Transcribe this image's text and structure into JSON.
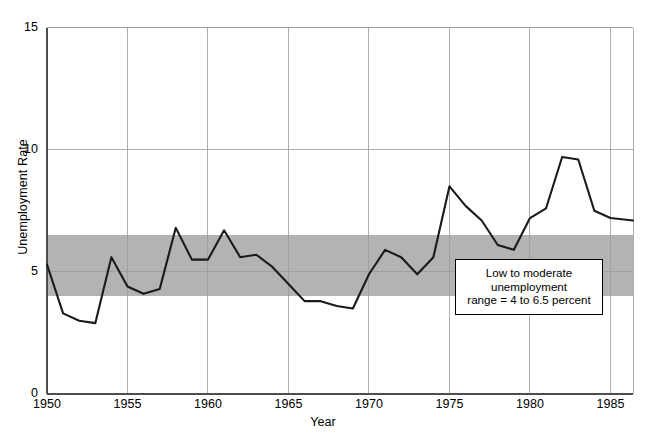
{
  "figure": {
    "cropped_caption_top": "",
    "axes": {
      "ylabel": "Unemployment Rate",
      "xlabel": "Year",
      "yticks": [
        "0",
        "5",
        "10",
        "15"
      ],
      "xticks": [
        "1950",
        "1955",
        "1960",
        "1965",
        "1970",
        "1975",
        "1980",
        "1985"
      ]
    },
    "annotation": {
      "line1": "Low to moderate",
      "line2": "unemployment",
      "line3": "range = 4 to 6.5 percent"
    },
    "colors": {
      "band_fill": "#b3b3b3",
      "line": "#1a1a1a",
      "grid": "#9a9a9a",
      "axis": "#4d4d4d",
      "background": "#ffffff"
    }
  },
  "chart_data": {
    "type": "line",
    "title": "",
    "subtitle": "",
    "xlabel": "Year",
    "ylabel": "Unemployment Rate",
    "xlim": [
      1950,
      1986.4
    ],
    "ylim": [
      0,
      15
    ],
    "ytick_values": [
      0,
      5,
      10,
      15
    ],
    "xtick_values": [
      1950,
      1955,
      1960,
      1965,
      1970,
      1975,
      1980,
      1985
    ],
    "grid": "vertical gridlines at each 5-year xtick; horizontal gridlines at 5, 10, 15",
    "legend": "none",
    "shaded_band": {
      "label": "Low to moderate unemployment range = 4 to 6.5 percent",
      "ymin": 4,
      "ymax": 6.5,
      "color": "#b3b3b3"
    },
    "annotations": [
      {
        "text": "Low to moderate unemployment range = 4 to 6.5 percent",
        "x": 1977.5,
        "y": 4.9,
        "boxed": true
      }
    ],
    "series": [
      {
        "name": "Unemployment Rate",
        "x": [
          1950,
          1951,
          1952,
          1953,
          1954,
          1955,
          1956,
          1957,
          1958,
          1959,
          1960,
          1961,
          1962,
          1963,
          1964,
          1965,
          1966,
          1967,
          1968,
          1969,
          1970,
          1971,
          1972,
          1973,
          1974,
          1975,
          1976,
          1977,
          1978,
          1979,
          1980,
          1981,
          1982,
          1983,
          1984,
          1985,
          1986.4
        ],
        "values": [
          5.3,
          3.3,
          3.0,
          2.9,
          5.6,
          4.4,
          4.1,
          4.3,
          6.8,
          5.5,
          5.5,
          6.7,
          5.6,
          5.7,
          5.2,
          4.5,
          3.8,
          3.8,
          3.6,
          3.5,
          4.9,
          5.9,
          5.6,
          4.9,
          5.6,
          8.5,
          7.7,
          7.1,
          6.1,
          5.9,
          7.2,
          7.6,
          9.7,
          9.6,
          7.5,
          7.2,
          7.1
        ]
      }
    ]
  }
}
